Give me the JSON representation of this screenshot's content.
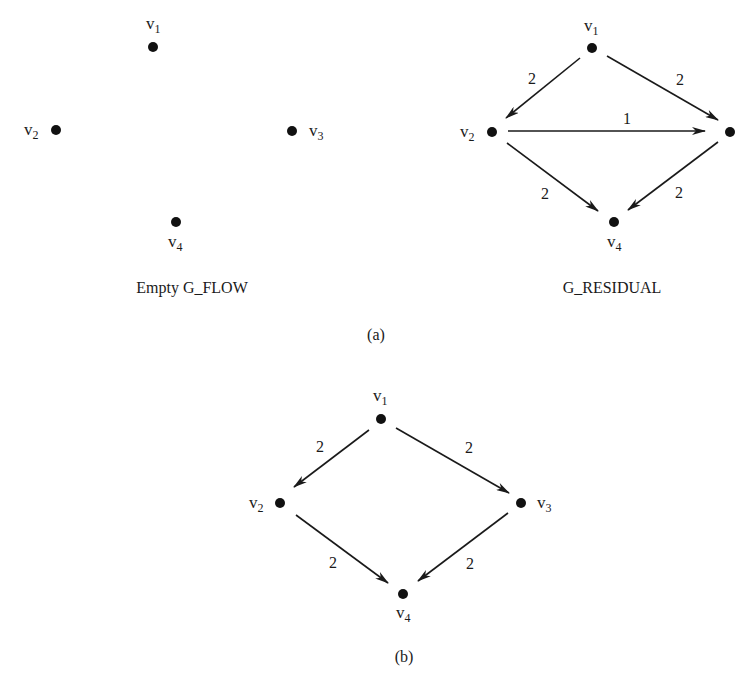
{
  "figure": {
    "panel_a_label": "(a)",
    "panel_b_label": "(b)"
  },
  "graphs": {
    "empty_flow": {
      "caption": "Empty G_FLOW",
      "nodes": [
        {
          "id": "v1",
          "base": "v",
          "sub": "1"
        },
        {
          "id": "v2",
          "base": "v",
          "sub": "2"
        },
        {
          "id": "v3",
          "base": "v",
          "sub": "3"
        },
        {
          "id": "v4",
          "base": "v",
          "sub": "4"
        }
      ],
      "edges": []
    },
    "residual": {
      "caption": "G_RESIDUAL",
      "nodes": [
        {
          "id": "v1",
          "base": "v",
          "sub": "1"
        },
        {
          "id": "v2",
          "base": "v",
          "sub": "2"
        },
        {
          "id": "v3",
          "base": "",
          "sub": ""
        },
        {
          "id": "v4",
          "base": "v",
          "sub": "4"
        }
      ],
      "edges": [
        {
          "from": "v1",
          "to": "v2",
          "weight": "2"
        },
        {
          "from": "v1",
          "to": "v3",
          "weight": "2"
        },
        {
          "from": "v2",
          "to": "v3",
          "weight": "1"
        },
        {
          "from": "v2",
          "to": "v4",
          "weight": "2"
        },
        {
          "from": "v3",
          "to": "v4",
          "weight": "2"
        }
      ]
    },
    "panel_b": {
      "caption": "",
      "nodes": [
        {
          "id": "v1",
          "base": "v",
          "sub": "1"
        },
        {
          "id": "v2",
          "base": "v",
          "sub": "2"
        },
        {
          "id": "v3",
          "base": "v",
          "sub": "3"
        },
        {
          "id": "v4",
          "base": "v",
          "sub": "4"
        }
      ],
      "edges": [
        {
          "from": "v1",
          "to": "v2",
          "weight": "2"
        },
        {
          "from": "v1",
          "to": "v3",
          "weight": "2"
        },
        {
          "from": "v2",
          "to": "v4",
          "weight": "2"
        },
        {
          "from": "v3",
          "to": "v4",
          "weight": "2"
        }
      ]
    }
  }
}
